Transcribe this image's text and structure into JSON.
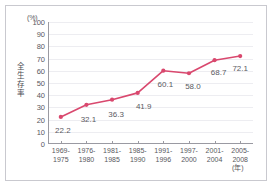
{
  "chart_data": {
    "type": "line",
    "title": "",
    "subtitle": "",
    "xlabel": "(年)",
    "ylabel": "全生存率",
    "unit_label": "(%)",
    "categories": [
      "1969-\n1975",
      "1976-\n1980",
      "1981-\n1985",
      "1985-\n1990",
      "1991-\n1996",
      "1997-\n2000",
      "2001-\n2004",
      "2005-\n2008"
    ],
    "category_lines": [
      [
        "1969-",
        "1975"
      ],
      [
        "1976-",
        "1980"
      ],
      [
        "1981-",
        "1985"
      ],
      [
        "1985-",
        "1990"
      ],
      [
        "1991-",
        "1996"
      ],
      [
        "1997-",
        "2000"
      ],
      [
        "2001-",
        "2004"
      ],
      [
        "2005-",
        "2008"
      ]
    ],
    "values": [
      22.2,
      32.1,
      36.3,
      41.9,
      60.1,
      58.0,
      68.7,
      72.1
    ],
    "value_labels": [
      "22.2",
      "32.1",
      "36.3",
      "41.9",
      "60.1",
      "58.0",
      "68.7",
      "72.1"
    ],
    "ylim": [
      0,
      100
    ],
    "yticks": [
      0,
      10,
      20,
      30,
      40,
      50,
      60,
      70,
      80,
      90,
      100
    ],
    "ytick_labels": [
      "0",
      "10",
      "20",
      "30",
      "40",
      "50",
      "60",
      "70",
      "80",
      "90",
      "100"
    ],
    "grid": true,
    "legend": "none",
    "series": [
      {
        "name": "全生存率",
        "values": [
          22.2,
          32.1,
          36.3,
          41.9,
          60.1,
          58.0,
          68.7,
          72.1
        ],
        "color": "#d9486e",
        "marker": "circle"
      }
    ],
    "colors": {
      "line": "#d9486e",
      "marker": "#d9486e",
      "grid": "#ededf1",
      "axis": "#9a9aa2",
      "text": "#58585e",
      "frame": "#c9c9cf",
      "background": "#ffffff"
    }
  }
}
